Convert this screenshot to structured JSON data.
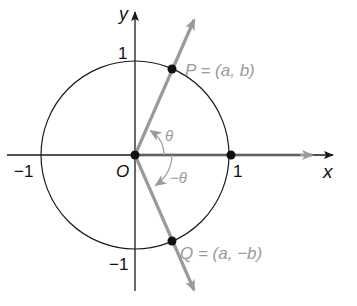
{
  "diagram": {
    "type": "unit-circle",
    "colors": {
      "axis": "#1a1a1a",
      "circle": "#1a1a1a",
      "ray": "#9a9a9a",
      "ray_label": "#9a9a9a",
      "point": "#111111",
      "text": "#111111"
    },
    "axes": {
      "x_label": "x",
      "y_label": "y"
    },
    "ticks": {
      "x_neg": "−1",
      "x_pos": "1",
      "y_pos": "1",
      "y_neg": "−1",
      "origin": "O"
    },
    "points": {
      "P": "P = (a, b)",
      "Q": "Q = (a, −b)"
    },
    "angles": {
      "positive": "θ",
      "negative": "−θ"
    }
  }
}
